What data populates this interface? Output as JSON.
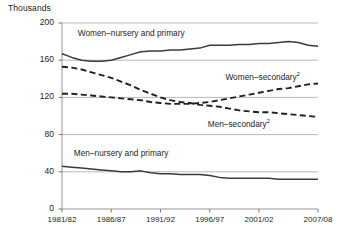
{
  "chart_data": {
    "type": "line",
    "title": "",
    "unit_label": "Thousands",
    "xlabel": "",
    "ylabel": "Thousands",
    "grid": true,
    "legend": "inline-annotations",
    "ylim": [
      0,
      200
    ],
    "yticks": [
      0,
      40,
      80,
      120,
      160,
      200
    ],
    "ytick_labels": [
      "0",
      "40",
      "80",
      "120",
      "160",
      "200"
    ],
    "xtick_labels": [
      "1981/82",
      "1986/87",
      "1991/92",
      "1996/97",
      "2001/02",
      "2007/08"
    ],
    "xtick_years": [
      1981,
      1986,
      1991,
      1996,
      2001,
      2007
    ],
    "x": [
      1981,
      1982,
      1983,
      1984,
      1985,
      1986,
      1987,
      1988,
      1989,
      1990,
      1991,
      1992,
      1993,
      1994,
      1995,
      1996,
      1997,
      1998,
      1999,
      2000,
      2001,
      2002,
      2003,
      2004,
      2005,
      2006,
      2007
    ],
    "series": [
      {
        "name": "Women–nursery and primary",
        "style": "solid",
        "color": "#3b3b3b",
        "label_x": 1982.6,
        "label_y": 188,
        "values": [
          167,
          163,
          160,
          159,
          159,
          160,
          163,
          166,
          169,
          170,
          170,
          171,
          171,
          172,
          173,
          176,
          176,
          176,
          177,
          177,
          178,
          178,
          179,
          180,
          179,
          176,
          175
        ]
      },
      {
        "name": "Women–secondary",
        "footnote": "2",
        "style": "dashed",
        "color": "#231f20",
        "label_x": 1997.6,
        "label_y": 141,
        "values": [
          124,
          124,
          123,
          122,
          121,
          120,
          119,
          118,
          117,
          115,
          114,
          113,
          113,
          113,
          114,
          115,
          117,
          119,
          121,
          123,
          125,
          127,
          129,
          130,
          132,
          134,
          135
        ]
      },
      {
        "name": "Men–secondary",
        "footnote": "2",
        "style": "dashed",
        "color": "#231f20",
        "label_x": 1995.8,
        "label_y": 90,
        "values": [
          153,
          152,
          150,
          147,
          144,
          141,
          137,
          133,
          128,
          124,
          120,
          117,
          115,
          114,
          112,
          111,
          110,
          108,
          106,
          105,
          104,
          104,
          103,
          102,
          101,
          100,
          99
        ]
      },
      {
        "name": "Men–nursery and primary",
        "style": "solid",
        "color": "#3b3b3b",
        "label_x": 1982.2,
        "label_y": 59,
        "values": [
          46,
          45,
          44,
          43,
          42,
          41,
          40,
          40,
          41,
          39,
          38,
          38,
          37,
          37,
          37,
          36,
          34,
          33,
          33,
          33,
          33,
          33,
          32,
          32,
          32,
          32,
          32
        ]
      }
    ]
  }
}
